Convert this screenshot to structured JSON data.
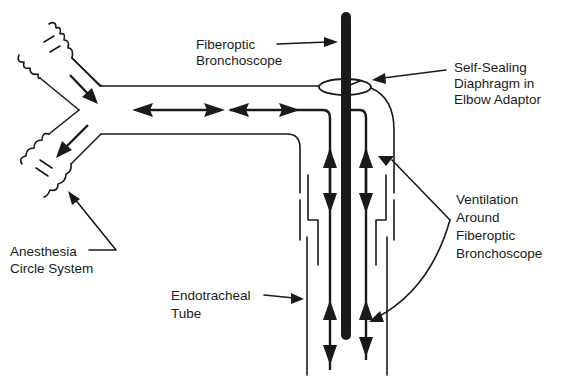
{
  "diagram": {
    "labels": {
      "fiberoptic_bronchoscope": [
        "Fiberoptic",
        "Bronchoscope"
      ],
      "self_sealing_diaphragm": [
        "Self-Sealing",
        "Diaphragm in",
        "Elbow Adaptor"
      ],
      "ventilation_around": [
        "Ventilation",
        "Around",
        "Fiberoptic",
        "Bronchoscope"
      ],
      "anesthesia_circle": [
        "Anesthesia",
        "Circle System"
      ],
      "endotracheal_tube": [
        "Endotracheal",
        "Tube"
      ]
    },
    "components": [
      {
        "id": "anesthesia-circle-system",
        "name": "Anesthesia Circle System",
        "part": "Y-piece with corrugated inspiratory and expiratory limbs"
      },
      {
        "id": "elbow-adaptor",
        "name": "Elbow Adaptor",
        "part": "horizontal limb bending down into tube"
      },
      {
        "id": "self-sealing-diaphragm",
        "name": "Self-Sealing Diaphragm in Elbow Adaptor",
        "part": "oval seal at elbow where scope enters"
      },
      {
        "id": "fiberoptic-bronchoscope",
        "name": "Fiberoptic Bronchoscope",
        "part": "thick black vertical rod"
      },
      {
        "id": "endotracheal-tube",
        "name": "Endotracheal Tube",
        "part": "outer vertical tube walls"
      }
    ],
    "flows": [
      {
        "id": "inspiratory",
        "direction": "into Y-piece from upper limb"
      },
      {
        "id": "expiratory",
        "direction": "out of Y-piece to lower limb"
      },
      {
        "id": "bidirectional-horizontal",
        "direction": "both ways along elbow adaptor"
      },
      {
        "id": "bidirectional-left-of-scope",
        "direction": "up and down around scope (left)"
      },
      {
        "id": "bidirectional-right-of-scope",
        "direction": "up and down around scope (right)"
      }
    ],
    "colors": {
      "ink": "#1a1a1a",
      "background": "#ffffff"
    }
  }
}
